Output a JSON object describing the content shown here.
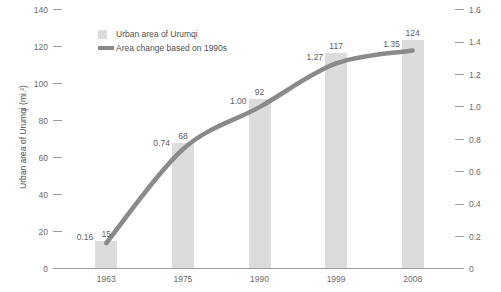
{
  "chart_data": {
    "type": "bar",
    "title": "",
    "subtitle": "",
    "categories": [
      "1963",
      "1975",
      "1990",
      "1999",
      "2008"
    ],
    "xlabel": "",
    "ylabel": "Urban area of Urumqi (mi.²)",
    "ylabel_right": "",
    "ylim": [
      0,
      140
    ],
    "ylim_right": [
      0,
      1.6
    ],
    "yticks": [
      "0",
      "20",
      "40",
      "60",
      "80",
      "100",
      "120",
      "140"
    ],
    "yticks_right": [
      "0",
      "0.2",
      "0.4",
      "0.6",
      "0.8",
      "1.0",
      "1.2",
      "1.4",
      "1.6"
    ],
    "grid": false,
    "legend_position": "top-left-inside",
    "series": [
      {
        "name": "Urban area of Urumqi",
        "kind": "bar",
        "axis": "left",
        "color": "#dcdcdc",
        "values": [
          15,
          68,
          92,
          117,
          124
        ],
        "labels": [
          "15",
          "68",
          "92",
          "117",
          "124"
        ]
      },
      {
        "name": "Area change based on 1990s",
        "kind": "line",
        "axis": "right",
        "color": "#8a8a8a",
        "values": [
          0.16,
          0.74,
          1.0,
          1.27,
          1.35
        ],
        "labels": [
          "0.16",
          "0.74",
          "1.00",
          "1.27",
          "1.35"
        ]
      }
    ]
  },
  "legend": {
    "items": [
      {
        "label": "Urban area of Urumqi",
        "icon": "bar-swatch-icon"
      },
      {
        "label": "Area change based on 1990s",
        "icon": "line-swatch-icon"
      }
    ]
  },
  "axes": {
    "left_title": "Urban area of Urumqi (mi.²)"
  },
  "colors": {
    "bar": "#dcdcdc",
    "line": "#8a8a8a",
    "axis": "#9a9a9a",
    "text": "#5e5e5e",
    "background": "#ffffff"
  }
}
